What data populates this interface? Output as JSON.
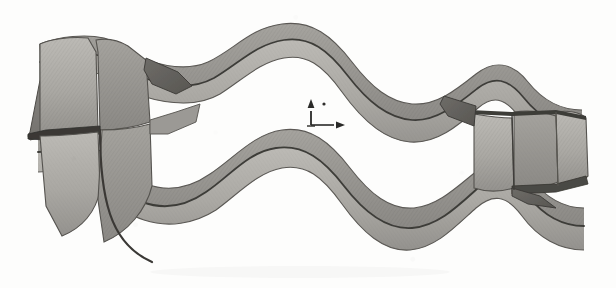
{
  "figure": {
    "kind": "line-drawing-3d-surface",
    "caption": "",
    "canvas": {
      "width": 616,
      "height": 288
    },
    "background_color": "#fdfdfc",
    "colors": {
      "paper": "#fdfdfc",
      "band_light": "#b4b2ad",
      "band_mid": "#9a9894",
      "band_dark": "#7e7c78",
      "band_shadow": "#6a6865",
      "edge_line": "#3a3936",
      "crease_line": "#4a4845",
      "axis_marker": "#2a2a28"
    }
  },
  "axis_marker": {
    "name": "coordinate-axes",
    "origin": {
      "x": 311,
      "y": 125
    },
    "x_axis": {
      "label": "",
      "dx": 28,
      "dy": 0,
      "arrow": "right"
    },
    "y_axis": {
      "label": "",
      "dx": 0,
      "dy": -20,
      "arrow": "up"
    },
    "dot": {
      "x": 324,
      "y": 104,
      "r": 1.6
    }
  },
  "geometry": {
    "band_width_px": 30,
    "loop_center": {
      "x": 308,
      "y": 144
    },
    "loop_extent": {
      "left": 28,
      "right": 588,
      "top": 18,
      "bottom": 268
    },
    "corrugation_count": 2,
    "upper_strand": {
      "name": "upper-wave-strand",
      "outline": "M 34 134 L 48 46 L 104 40 L 118 56 L 150 64 L 176 74 L 206 66 L 250 30 L 296 28 L 340 52 L 372 90 L 404 104 L 440 96 L 470 72 L 502 72 L 528 100 L 560 108 L 586 108 L 586 150 L 556 146 L 524 140 L 498 112 L 470 112 L 438 138 L 398 146 L 360 130 L 326 92 L 292 68 L 252 70 L 212 106 L 178 114 L 146 104 L 118 96 L 104 80 L 48 86 Z"
    },
    "lower_strand": {
      "name": "lower-wave-strand",
      "outline": "M 34 150 L 48 238 L 104 244 L 118 228 L 150 220 L 176 210 L 206 218 L 250 254 L 296 256 L 340 232 L 372 194 L 404 180 L 440 188 L 470 212 L 502 212 L 528 184 L 560 176 L 586 176 Z"
    }
  },
  "labels": {
    "items": []
  }
}
